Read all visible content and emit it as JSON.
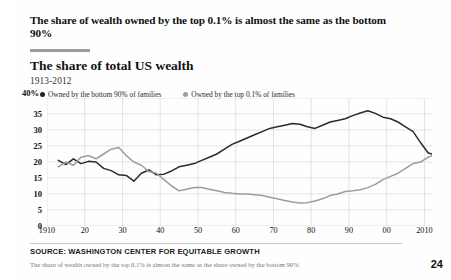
{
  "headline": "The share of wealth owned by the top 0.1% is almost the same as the bottom 90%",
  "subtitle": "The share of total US wealth",
  "daterange": "1913-2012",
  "y_axis_top_label": "40%",
  "source": "SOURCE: WASHINGTON CENTER FOR EQUITABLE GROWTH",
  "caption": "The share of wealth owned by the top 0.1% is almost the same as the share owned by the bottom 90%",
  "page_number": "24",
  "colors": {
    "bottom90_line": "#2b2b2b",
    "top01_line": "#9d9d9d",
    "grid": "#d8d8d8",
    "rule": "#9a9a9a",
    "text": "#111111"
  },
  "legend": [
    {
      "label": "Owned by the bottom 90% of families",
      "color": "#222222",
      "marker": "filled-circle"
    },
    {
      "label": "Owned by the top 0.1% of families",
      "color": "#9d9d9d",
      "marker": "filled-circle"
    }
  ],
  "chart_data": {
    "type": "line",
    "title": "The share of total US wealth",
    "subtitle": "1913-2012",
    "xlabel": "",
    "ylabel": "",
    "xlim": [
      1910,
      2012
    ],
    "ylim": [
      0,
      40
    ],
    "ytick_values": [
      0,
      5,
      10,
      15,
      20,
      25,
      30,
      35,
      40
    ],
    "ytick_labels": [
      "0",
      "5",
      "10",
      "15",
      "20",
      "25",
      "30",
      "35",
      "40%"
    ],
    "xtick_values": [
      1910,
      1920,
      1930,
      1940,
      1950,
      1960,
      1970,
      1980,
      1990,
      2000,
      2010
    ],
    "xtick_labels": [
      "1910",
      "20",
      "30",
      "40",
      "50",
      "60",
      "70",
      "80",
      "90",
      "00",
      "2010"
    ],
    "grid": true,
    "legend_position": "top",
    "units": "percent of total US wealth",
    "series": [
      {
        "name": "Owned by the bottom 90% of families",
        "color": "#2b2b2b",
        "x": [
          1913,
          1915,
          1917,
          1919,
          1921,
          1923,
          1925,
          1927,
          1929,
          1931,
          1933,
          1935,
          1937,
          1939,
          1941,
          1943,
          1945,
          1947,
          1949,
          1951,
          1953,
          1955,
          1957,
          1959,
          1961,
          1963,
          1965,
          1967,
          1969,
          1971,
          1973,
          1975,
          1977,
          1979,
          1981,
          1983,
          1985,
          1987,
          1989,
          1991,
          1993,
          1995,
          1997,
          1999,
          2001,
          2003,
          2005,
          2007,
          2009,
          2011,
          2012
        ],
        "y": [
          20.5,
          19.2,
          21.0,
          19.5,
          20.2,
          20.0,
          18.0,
          17.3,
          16.0,
          15.8,
          14.0,
          16.5,
          17.5,
          16.0,
          16.2,
          17.2,
          18.5,
          19.0,
          19.5,
          20.5,
          21.5,
          22.5,
          24.0,
          25.5,
          26.5,
          27.5,
          28.5,
          29.5,
          30.5,
          31.0,
          31.5,
          32.0,
          31.8,
          31.0,
          30.5,
          31.5,
          32.5,
          33.0,
          33.5,
          34.5,
          35.3,
          36.0,
          35.2,
          34.0,
          33.5,
          32.5,
          31.0,
          29.5,
          26.0,
          22.8,
          22.5
        ]
      },
      {
        "name": "Owned by the top 0.1% of families",
        "color": "#9d9d9d",
        "x": [
          1913,
          1915,
          1917,
          1919,
          1921,
          1923,
          1925,
          1927,
          1929,
          1931,
          1933,
          1935,
          1937,
          1939,
          1941,
          1943,
          1945,
          1947,
          1949,
          1951,
          1953,
          1955,
          1957,
          1959,
          1961,
          1963,
          1965,
          1967,
          1969,
          1971,
          1973,
          1975,
          1977,
          1979,
          1981,
          1983,
          1985,
          1987,
          1989,
          1991,
          1993,
          1995,
          1997,
          1999,
          2001,
          2003,
          2005,
          2007,
          2009,
          2011,
          2012
        ],
        "y": [
          18.5,
          20.0,
          19.0,
          21.5,
          22.0,
          21.0,
          22.5,
          24.0,
          24.5,
          22.0,
          20.0,
          19.0,
          17.0,
          16.5,
          14.5,
          12.5,
          11.0,
          11.5,
          12.0,
          12.0,
          11.5,
          11.0,
          10.5,
          10.2,
          10.0,
          10.0,
          9.8,
          9.5,
          9.0,
          8.5,
          8.0,
          7.5,
          7.2,
          7.3,
          7.8,
          8.5,
          9.5,
          10.0,
          10.8,
          11.0,
          11.3,
          12.0,
          13.0,
          14.5,
          15.5,
          16.5,
          18.0,
          19.5,
          20.0,
          21.5,
          22.0
        ]
      }
    ]
  }
}
